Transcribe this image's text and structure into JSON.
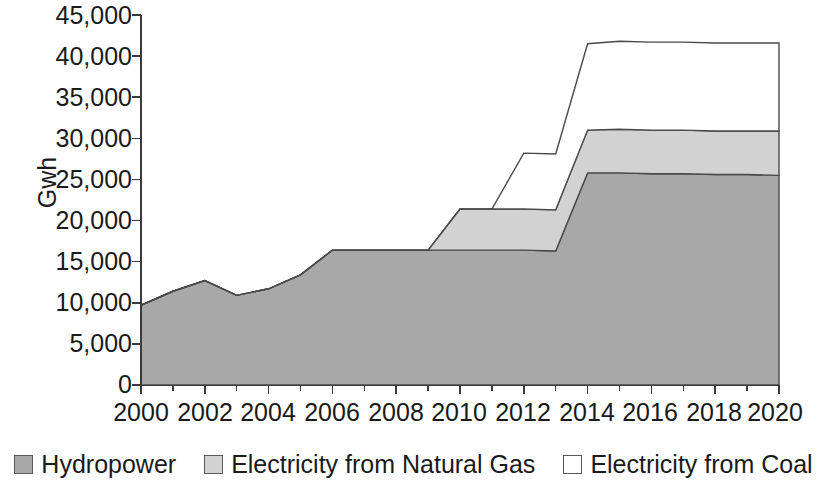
{
  "chart_data": {
    "type": "area",
    "title": "",
    "subtitle": "",
    "xlabel": "",
    "ylabel": "Gwh",
    "stacked": true,
    "grid": false,
    "legend_position": "bottom",
    "xlim": [
      2000,
      2020
    ],
    "ylim": [
      0,
      45000
    ],
    "x": [
      2000,
      2001,
      2002,
      2003,
      2004,
      2005,
      2006,
      2007,
      2008,
      2009,
      2010,
      2011,
      2012,
      2013,
      2014,
      2015,
      2016,
      2017,
      2018,
      2019,
      2020
    ],
    "x_tick_labels": [
      "2000",
      "2002",
      "2004",
      "2006",
      "2008",
      "2010",
      "2012",
      "2014",
      "2016",
      "2018",
      "2020"
    ],
    "x_tick_values": [
      2000,
      2002,
      2004,
      2006,
      2008,
      2010,
      2012,
      2014,
      2016,
      2018,
      2020
    ],
    "y_tick_labels": [
      "45,000",
      "40,000",
      "35,000",
      "30,000",
      "25,000",
      "20,000",
      "15,000",
      "10,000",
      "5,000",
      "0"
    ],
    "y_tick_values": [
      45000,
      40000,
      35000,
      30000,
      25000,
      20000,
      15000,
      10000,
      5000,
      0
    ],
    "series": [
      {
        "name": "Hydropower",
        "color": "#a8a8a8",
        "line_color": "#4a4a4a",
        "values": [
          9700,
          11400,
          12700,
          10900,
          11700,
          13400,
          16400,
          16400,
          16400,
          16400,
          16400,
          16400,
          16400,
          16300,
          25800,
          25800,
          25700,
          25700,
          25600,
          25600,
          25500
        ]
      },
      {
        "name": "Electricity from Natural Gas",
        "color": "#d2d2d2",
        "line_color": "#4a4a4a",
        "values": [
          0,
          0,
          0,
          0,
          0,
          0,
          0,
          0,
          0,
          0,
          5000,
          5000,
          5000,
          5000,
          5200,
          5300,
          5300,
          5300,
          5300,
          5300,
          5400
        ]
      },
      {
        "name": "Electricity from Coal",
        "color": "#ffffff",
        "line_color": "#4a4a4a",
        "values": [
          0,
          0,
          0,
          0,
          0,
          0,
          0,
          0,
          0,
          0,
          0,
          0,
          6800,
          6800,
          10500,
          10700,
          10700,
          10700,
          10700,
          10700,
          10700
        ]
      }
    ],
    "stack_tops": {
      "hydropower": [
        9700,
        11400,
        12700,
        10900,
        11700,
        13400,
        16400,
        16400,
        16400,
        16400,
        16400,
        16400,
        16400,
        16300,
        25800,
        25800,
        25700,
        25700,
        25600,
        25600,
        25500
      ],
      "natural_gas": [
        9700,
        11400,
        12700,
        10900,
        11700,
        13400,
        16400,
        16400,
        16400,
        16400,
        21400,
        21400,
        21400,
        21300,
        31000,
        31100,
        31000,
        31000,
        30900,
        30900,
        30900
      ],
      "coal": [
        9700,
        11400,
        12700,
        10900,
        11700,
        13400,
        16400,
        16400,
        16400,
        16400,
        21400,
        21400,
        28200,
        28100,
        41500,
        41800,
        41700,
        41700,
        41600,
        41600,
        41600
      ]
    }
  },
  "axis": {
    "y_label": "Gwh",
    "y_ticks": [
      "45,000",
      "40,000",
      "35,000",
      "30,000",
      "25,000",
      "20,000",
      "15,000",
      "10,000",
      "5,000",
      "0"
    ],
    "x_ticks": [
      "2000",
      "2002",
      "2004",
      "2006",
      "2008",
      "2010",
      "2012",
      "2014",
      "2016",
      "2018",
      "2020"
    ]
  },
  "legend": {
    "items": [
      {
        "label": "Hydropower",
        "color": "#a8a8a8"
      },
      {
        "label": "Electricity from Natural Gas",
        "color": "#d2d2d2"
      },
      {
        "label": "Electricity from Coal",
        "color": "#ffffff"
      }
    ]
  }
}
